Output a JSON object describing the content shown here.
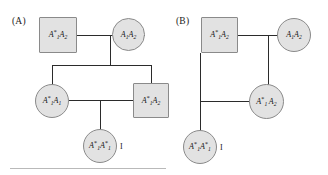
{
  "figure": {
    "panels": [
      {
        "id": "A",
        "label": "(A)",
        "individuals": [
          {
            "id": "a-father",
            "shape": "square",
            "sex": "male",
            "role": "father",
            "genotype_text": "A*1A2",
            "allele1": "A",
            "allele1_sub": "1",
            "allele1_star": "*",
            "allele2": "A",
            "allele2_sub": "2",
            "allele2_star": ""
          },
          {
            "id": "a-mother",
            "shape": "circle",
            "sex": "female",
            "role": "mother",
            "genotype_text": "A1A2",
            "allele1": "A",
            "allele1_sub": "1",
            "allele1_star": "",
            "allele2": "A",
            "allele2_sub": "2",
            "allele2_star": ""
          },
          {
            "id": "a-daughter",
            "shape": "circle",
            "sex": "female",
            "role": "daughter",
            "genotype_text": "A*1A1",
            "allele1": "A",
            "allele1_sub": "1",
            "allele1_star": "*",
            "allele2": "A",
            "allele2_sub": "1",
            "allele2_star": ""
          },
          {
            "id": "a-son",
            "shape": "square",
            "sex": "male",
            "role": "son",
            "genotype_text": "A*1A2",
            "allele1": "A",
            "allele1_sub": "1",
            "allele1_star": "*",
            "allele2": "A",
            "allele2_sub": "2",
            "allele2_star": ""
          },
          {
            "id": "a-child",
            "shape": "circle",
            "sex": "female",
            "role": "affected-offspring",
            "genotype_text": "A*1A*1",
            "allele1": "A",
            "allele1_sub": "1",
            "allele1_star": "*",
            "allele2": "A",
            "allele2_sub": "1",
            "allele2_star": "*"
          }
        ],
        "proband_label": "I"
      },
      {
        "id": "B",
        "label": "(B)",
        "individuals": [
          {
            "id": "b-father",
            "shape": "square",
            "sex": "male",
            "role": "father",
            "genotype_text": "A*1A2",
            "allele1": "A",
            "allele1_sub": "1",
            "allele1_star": "*",
            "allele2": "A",
            "allele2_sub": "2",
            "allele2_star": ""
          },
          {
            "id": "b-mother",
            "shape": "circle",
            "sex": "female",
            "role": "mother",
            "genotype_text": "A1A2",
            "allele1": "A",
            "allele1_sub": "1",
            "allele1_star": "",
            "allele2": "A",
            "allele2_sub": "2",
            "allele2_star": ""
          },
          {
            "id": "b-daughter",
            "shape": "circle",
            "sex": "female",
            "role": "daughter",
            "genotype_text": "A*1 A2",
            "allele1": "A",
            "allele1_sub": "1",
            "allele1_star": "*",
            "allele2": "A",
            "allele2_sub": "2",
            "allele2_star": "",
            "spaced": true
          },
          {
            "id": "b-child",
            "shape": "circle",
            "sex": "female",
            "role": "affected-offspring",
            "genotype_text": "A*1A*1",
            "allele1": "A",
            "allele1_sub": "1",
            "allele1_star": "*",
            "allele2": "A",
            "allele2_sub": "1",
            "allele2_star": "*"
          }
        ],
        "proband_label": "I"
      }
    ],
    "colors": {
      "shape_fill": "#e2e2e2",
      "shape_stroke": "#8a8a8a",
      "pedigree_line": "#2b2b2b",
      "text": "#111111",
      "rule": "#b9b9b9",
      "background": "#ffffff"
    }
  }
}
